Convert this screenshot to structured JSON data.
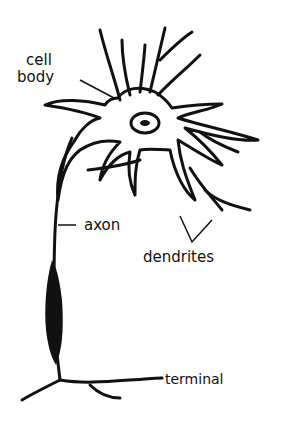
{
  "diagram": {
    "labels": {
      "cell_body_line1": "cell",
      "cell_body_line2": "body",
      "axon": "axon",
      "dendrites": "dendrites",
      "terminal": "terminal"
    },
    "colors": {
      "ink": "#111111",
      "background": "#ffffff"
    }
  }
}
